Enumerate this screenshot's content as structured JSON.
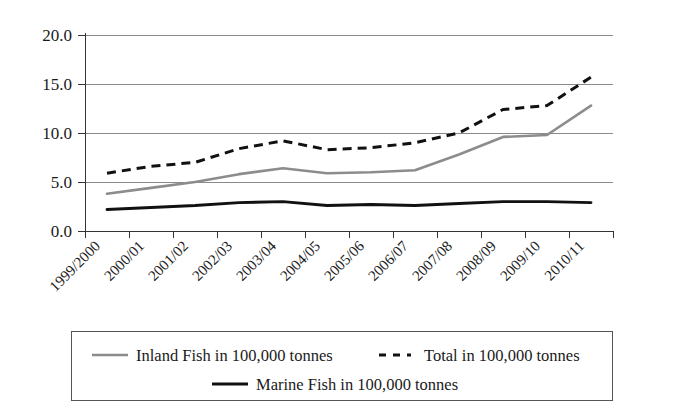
{
  "chart_data": {
    "type": "line",
    "title": "",
    "subtitle": "",
    "xlabel": "",
    "ylabel": "",
    "ylim": [
      0.0,
      20.0
    ],
    "ytick_labels": [
      "0.0",
      "5.0",
      "10.0",
      "15.0",
      "20.0"
    ],
    "ytick_values": [
      0.0,
      5.0,
      10.0,
      15.0,
      20.0
    ],
    "grid": true,
    "legend_position": "bottom",
    "categories": [
      "1999/2000",
      "2000/01",
      "2001/02",
      "2002/03",
      "2003/04",
      "2004/05",
      "2005/06",
      "2006/07",
      "2007/08",
      "2008/09",
      "2009/10",
      "2010/11"
    ],
    "series": [
      {
        "name": "Inland Fish in 100,000 tonnes",
        "style": "solid",
        "color": "#8c8c8c",
        "values": [
          3.8,
          4.4,
          5.0,
          5.8,
          6.4,
          5.9,
          6.0,
          6.2,
          7.8,
          9.6,
          9.8,
          12.8
        ]
      },
      {
        "name": "Total in 100,000 tonnes",
        "style": "dashed",
        "color": "#111111",
        "values": [
          5.9,
          6.6,
          7.0,
          8.4,
          9.2,
          8.3,
          8.5,
          9.0,
          10.0,
          12.4,
          12.8,
          15.7
        ]
      },
      {
        "name": "Marine Fish in 100,000 tonnes",
        "style": "solid",
        "color": "#111111",
        "values": [
          2.2,
          2.4,
          2.6,
          2.9,
          3.0,
          2.6,
          2.7,
          2.6,
          2.8,
          3.0,
          3.0,
          2.9
        ]
      }
    ]
  },
  "legend": {
    "entries": [
      {
        "label": "Inland Fish in 100,000 tonnes",
        "style": "solid",
        "color": "#8c8c8c"
      },
      {
        "label": "Total in 100,000 tonnes",
        "style": "dashed",
        "color": "#111111"
      },
      {
        "label": "Marine Fish in 100,000 tonnes",
        "style": "solid",
        "color": "#111111"
      }
    ]
  },
  "colors": {
    "background": "#ffffff",
    "axis": "#333333",
    "grid": "#8a8a8a",
    "inland": "#8c8c8c",
    "total": "#111111",
    "marine": "#111111"
  }
}
